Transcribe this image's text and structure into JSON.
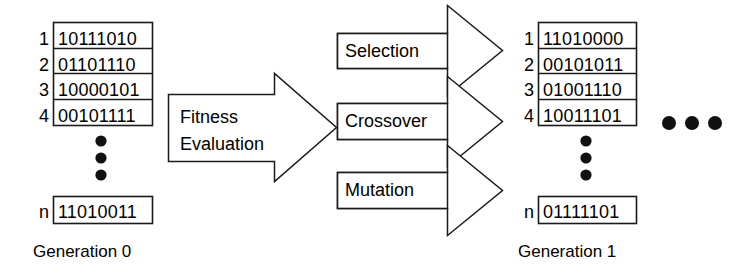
{
  "diagram": {
    "stroke_color": "#1a1a1a",
    "fill_color": "#ffffff",
    "text_color": "#000000"
  },
  "left_population": {
    "caption": "Generation 0",
    "rows": [
      {
        "index": "1",
        "bits": "10111010"
      },
      {
        "index": "2",
        "bits": "01101110"
      },
      {
        "index": "3",
        "bits": "10000101"
      },
      {
        "index": "4",
        "bits": "00101111"
      }
    ],
    "ellipsis": "vertical-dots",
    "last_row": {
      "index": "n",
      "bits": "11010011"
    }
  },
  "fitness_arrow": {
    "line1": "Fitness",
    "line2": "Evaluation"
  },
  "operators": [
    {
      "name": "selection",
      "label": "Selection"
    },
    {
      "name": "crossover",
      "label": "Crossover"
    },
    {
      "name": "mutation",
      "label": "Mutation"
    }
  ],
  "right_population": {
    "caption": "Generation 1",
    "rows": [
      {
        "index": "1",
        "bits": "11010000"
      },
      {
        "index": "2",
        "bits": "00101011"
      },
      {
        "index": "3",
        "bits": "01001110"
      },
      {
        "index": "4",
        "bits": "10011101"
      }
    ],
    "ellipsis": "vertical-dots",
    "last_row": {
      "index": "n",
      "bits": "01111101"
    }
  },
  "continuation": {
    "label": "horizontal-dots"
  }
}
